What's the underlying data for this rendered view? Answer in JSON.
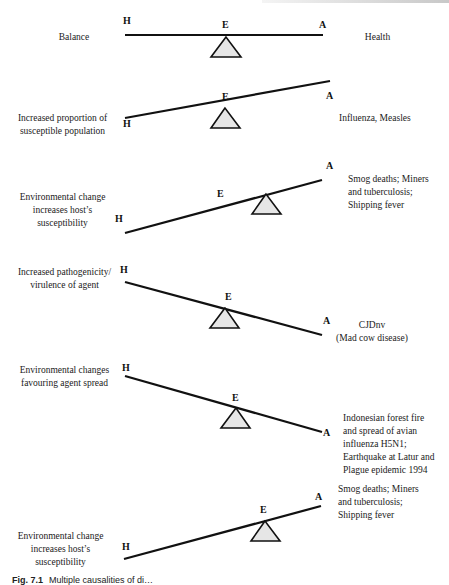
{
  "figure": {
    "caption_prefix": "Fig. 7.1",
    "caption_text": "Multiple causalities of di…",
    "node_labels": {
      "host": "H",
      "environment": "E",
      "agent": "A"
    },
    "colors": {
      "beam": "#111111",
      "fulcrum_fill": "#e6e6e6",
      "fulcrum_stroke": "#111111",
      "text": "#1a1a1a"
    }
  },
  "panels": [
    {
      "id": "balance",
      "tilt": "level",
      "condition_lines": [
        "Balance"
      ],
      "outcome_lines": [
        "Health"
      ]
    },
    {
      "id": "susceptible-population",
      "tilt": "agent-side up",
      "condition_lines": [
        "Increased proportion of",
        "susceptible population"
      ],
      "outcome_lines": [
        "Influenza, Measles"
      ]
    },
    {
      "id": "host-susceptibility-1",
      "tilt": "agent-side up, fulcrum shifted toward agent",
      "condition_lines": [
        "Environmental change",
        "increases host’s",
        "susceptibility"
      ],
      "outcome_lines": [
        "Smog deaths; Miners",
        "and tuberculosis;",
        "Shipping fever"
      ]
    },
    {
      "id": "agent-virulence",
      "tilt": "host-side up",
      "condition_lines": [
        "Increased pathogenicity/",
        "virulence of agent"
      ],
      "outcome_lines": [
        "CJDnv",
        "(Mad cow disease)"
      ]
    },
    {
      "id": "agent-spread",
      "tilt": "host-side up, fulcrum shifted toward agent",
      "condition_lines": [
        "Environmental changes",
        "favouring agent spread"
      ],
      "outcome_lines": [
        "Indonesian forest fire",
        "and spread of avian",
        "influenza H5N1;",
        "Earthquake at Latur and",
        "Plague epidemic 1994"
      ]
    },
    {
      "id": "host-susceptibility-2",
      "tilt": "agent-side up, fulcrum shifted toward agent",
      "condition_lines": [
        "Environmental change",
        "increases host’s",
        "susceptibility"
      ],
      "outcome_lines": [
        "Smog deaths; Miners",
        "and tuberculosis;",
        "Shipping fever"
      ]
    }
  ]
}
